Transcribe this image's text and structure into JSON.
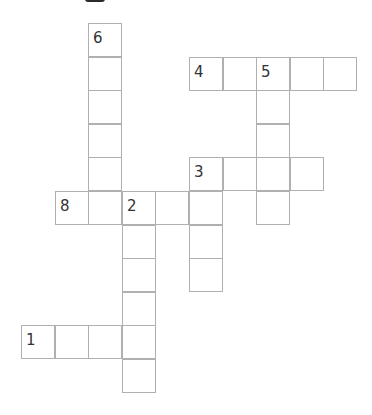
{
  "puzzle": {
    "type": "crossword",
    "cell_pitch": 33.6,
    "origin": {
      "x": 21,
      "y": 23
    },
    "colors": {
      "border": "#b0b0b0",
      "number": "#333333",
      "background": "#ffffff"
    },
    "words": [
      {
        "number": "6",
        "direction": "down",
        "col": 2,
        "row": 0,
        "length": 6
      },
      {
        "number": "4",
        "direction": "across",
        "col": 5,
        "row": 1,
        "length": 5
      },
      {
        "number": "5",
        "direction": "down",
        "col": 7,
        "row": 1,
        "length": 5
      },
      {
        "number": "3",
        "direction": "across",
        "col": 5,
        "row": 4,
        "length": 4
      },
      {
        "number": "3",
        "direction": "down",
        "col": 5,
        "row": 4,
        "length": 4
      },
      {
        "number": "8",
        "direction": "across",
        "col": 1,
        "row": 5,
        "length": 5
      },
      {
        "number": "2",
        "direction": "down",
        "col": 3,
        "row": 5,
        "length": 6
      },
      {
        "number": "1",
        "direction": "across",
        "col": 0,
        "row": 9,
        "length": 4
      }
    ],
    "numbered_cells": [
      {
        "label": "6",
        "col": 2,
        "row": 0
      },
      {
        "label": "4",
        "col": 5,
        "row": 1
      },
      {
        "label": "5",
        "col": 7,
        "row": 1
      },
      {
        "label": "3",
        "col": 5,
        "row": 4
      },
      {
        "label": "8",
        "col": 1,
        "row": 5
      },
      {
        "label": "2",
        "col": 3,
        "row": 5
      },
      {
        "label": "1",
        "col": 0,
        "row": 9
      }
    ]
  }
}
